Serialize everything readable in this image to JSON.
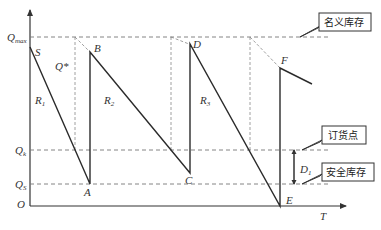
{
  "figure": {
    "type": "inventory-sawtooth",
    "axes": {
      "y_label": "",
      "x_label": "T",
      "origin": "O"
    },
    "levels": {
      "qmax": {
        "label": "Q",
        "sub": "max",
        "callout": "名义库存"
      },
      "qk": {
        "label": "Q",
        "sub": "k",
        "callout": "订货点"
      },
      "qs": {
        "label": "Q",
        "sub": "S",
        "callout": "安全库存"
      }
    },
    "points": {
      "S": "S",
      "A": "A",
      "B": "B",
      "C": "C",
      "D": "D",
      "E": "E",
      "F": "F"
    },
    "rates": [
      {
        "label": "R",
        "sub": "1"
      },
      {
        "label": "R",
        "sub": "2"
      },
      {
        "label": "R",
        "sub": "3"
      }
    ],
    "order_qty": "Q*",
    "safety_band": {
      "label": "D",
      "sub": "1"
    }
  }
}
